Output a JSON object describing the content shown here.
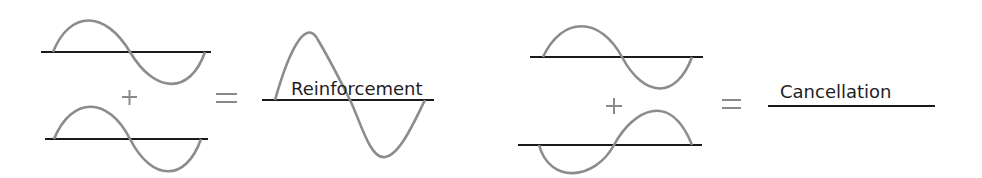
{
  "diagram": {
    "colors": {
      "wave": "#8c8c8c",
      "axis": "#1a1a1a",
      "operator": "#8a8a8a",
      "text": "#1e1e1e"
    },
    "left_equation": {
      "operator_plus": "+",
      "operator_equals": "=",
      "result_label": "Reinforcement",
      "wave_a": {
        "phase": "in-phase",
        "amplitude": 1
      },
      "wave_b": {
        "phase": "in-phase",
        "amplitude": 1
      },
      "result": {
        "amplitude": 2
      }
    },
    "right_equation": {
      "operator_plus": "+",
      "operator_equals": "=",
      "result_label": "Cancellation",
      "wave_a": {
        "phase": "0",
        "amplitude": 1
      },
      "wave_b": {
        "phase": "180-degrees-out",
        "amplitude": 1
      },
      "result": {
        "amplitude": 0
      }
    }
  }
}
